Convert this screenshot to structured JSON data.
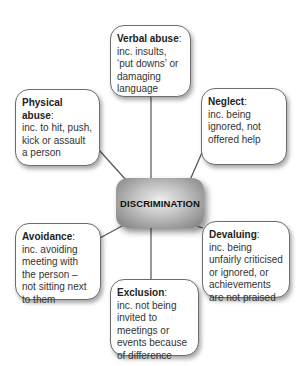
{
  "diagram": {
    "center": {
      "label": "DISCRIMINATION"
    },
    "nodes": [
      {
        "id": "verbal-abuse",
        "title": "Verbal abuse",
        "sep": ":",
        "text": "inc. insults, ‘put downs’ or damaging language"
      },
      {
        "id": "physical-abuse",
        "title": "Physical abuse",
        "sep": ":",
        "text": "inc. to hit, push, kick or assault a person"
      },
      {
        "id": "neglect",
        "title": "Neglect",
        "sep": ":",
        "text": "inc. being ignored, not offered help"
      },
      {
        "id": "avoidance",
        "title": "Avoidance",
        "sep": ":",
        "text": "inc. avoiding meeting with the person – not sitting next to them"
      },
      {
        "id": "devaluing",
        "title": "Devaluing",
        "sep": ":",
        "text": "inc. being unfairly criticised or ignored, or achievements are not praised"
      },
      {
        "id": "exclusion",
        "title": "Exclusion",
        "sep": ":",
        "text": "inc. not being invited to meetings or events because of difference"
      }
    ],
    "colors": {
      "border": "#6d6d6d",
      "line": "#555555",
      "text": "#333333"
    }
  }
}
